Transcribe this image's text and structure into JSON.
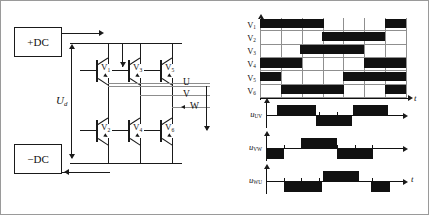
{
  "circuit": {
    "dc_positive": "+DC",
    "dc_negative": "−DC",
    "bus_voltage_symbol": "U",
    "bus_voltage_subscript": "d",
    "outputs": [
      {
        "label": "U"
      },
      {
        "label": "V"
      },
      {
        "label": "W"
      }
    ],
    "transistors": [
      {
        "label": "V",
        "sub": "1",
        "position": "upper-left"
      },
      {
        "label": "V",
        "sub": "3",
        "position": "upper-middle"
      },
      {
        "label": "V",
        "sub": "5",
        "position": "upper-right"
      },
      {
        "label": "V",
        "sub": "2",
        "position": "lower-left"
      },
      {
        "label": "V",
        "sub": "4",
        "position": "lower-middle"
      },
      {
        "label": "V",
        "sub": "6",
        "position": "lower-right"
      }
    ]
  },
  "chart_data": {
    "type": "timing",
    "xlabel": "t",
    "segments": 7,
    "signal_names": [
      "V1",
      "V2",
      "V3",
      "V4",
      "V5",
      "V6"
    ],
    "rows": [
      {
        "name": "V",
        "sub": "1",
        "pulses": [
          [
            0.0,
            0.435
          ],
          [
            0.855,
            1.0
          ]
        ]
      },
      {
        "name": "V",
        "sub": "2",
        "pulses": [
          [
            0.425,
            0.855
          ]
        ]
      },
      {
        "name": "V",
        "sub": "3",
        "pulses": [
          [
            0.275,
            0.715
          ]
        ]
      },
      {
        "name": "V",
        "sub": "4",
        "pulses": [
          [
            0.0,
            0.285
          ],
          [
            0.715,
            1.0
          ]
        ]
      },
      {
        "name": "V",
        "sub": "5",
        "pulses": [
          [
            0.0,
            0.145
          ],
          [
            0.57,
            1.0
          ]
        ]
      },
      {
        "name": "V",
        "sub": "6",
        "pulses": [
          [
            0.145,
            0.575
          ],
          [
            0.855,
            1.0
          ]
        ]
      }
    ],
    "line_voltages": [
      {
        "name": "u",
        "sub": "UV",
        "axis_label": "t",
        "show_t": false,
        "positive": [
          [
            0.085,
            0.4
          ],
          [
            0.7,
            0.985
          ]
        ],
        "negative": [
          [
            0.405,
            0.695
          ]
        ]
      },
      {
        "name": "u",
        "sub": "VW",
        "axis_label": "t",
        "show_t": false,
        "positive": [
          [
            0.285,
            0.575
          ]
        ],
        "negative": [
          [
            0.0,
            0.145
          ],
          [
            0.575,
            0.865
          ]
        ]
      },
      {
        "name": "u",
        "sub": "WU",
        "axis_label": "t",
        "show_t": true,
        "positive": [
          [
            0.46,
            0.75
          ]
        ],
        "negative": [
          [
            0.145,
            0.455
          ],
          [
            0.845,
            1.0
          ]
        ]
      }
    ]
  },
  "colors": {
    "ink": "#111111",
    "grid": "#8f8f8f",
    "bus": "#8d8d8d",
    "frame": "#9a9a9a",
    "background": "#ffffff"
  }
}
